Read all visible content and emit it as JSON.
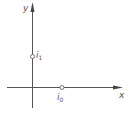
{
  "diagram": {
    "axes": {
      "x_label": "x",
      "y_label": "y"
    },
    "points": [
      {
        "name": "i",
        "subscript": "1",
        "position": "on y-axis"
      },
      {
        "name": "i",
        "subscript": "0",
        "position": "on x-axis"
      }
    ],
    "colors": {
      "stroke": "#555555",
      "background": "#ffffff"
    }
  }
}
